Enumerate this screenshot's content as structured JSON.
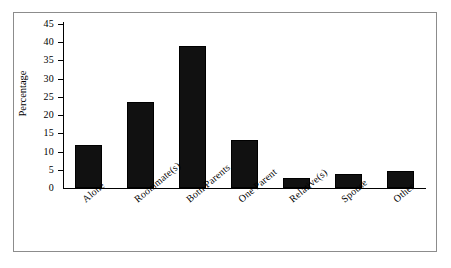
{
  "chart_data": {
    "type": "bar",
    "title": "",
    "subtitle": "",
    "xlabel": "",
    "ylabel": "Percentage",
    "categories": [
      "Alone",
      "Roommate(s)",
      "Both Parents",
      "One Parent",
      "Relative(s)",
      "Spouse",
      "Other"
    ],
    "values": [
      11.8,
      23.5,
      39.0,
      13.2,
      2.7,
      3.9,
      4.6
    ],
    "ylim": [
      0,
      45
    ],
    "ytick_labels": [
      "45",
      "40",
      "35",
      "30",
      "25",
      "20",
      "15",
      "10",
      "5",
      "0"
    ],
    "ytick_values": [
      45,
      40,
      35,
      30,
      25,
      20,
      15,
      10,
      5,
      0
    ],
    "ytick_step": 5,
    "grid": false,
    "legend": null,
    "legend_position": "none",
    "bar_color": "#111111",
    "axis_color": "#000000",
    "frame_color": "#8c8c8c",
    "background_color": "#ffffff",
    "xtick_label_rotation": -40
  }
}
